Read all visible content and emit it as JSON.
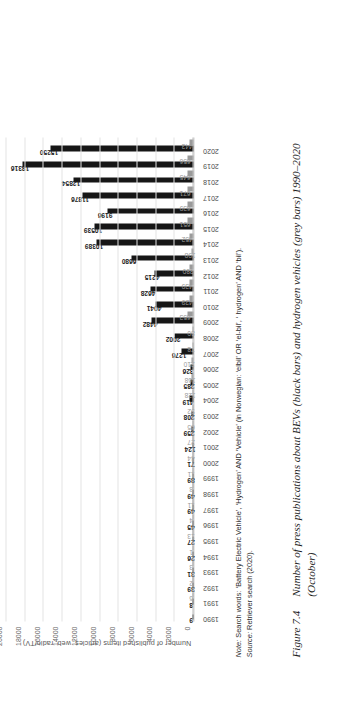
{
  "figure": {
    "number": "Figure 7.4",
    "caption_line1": "Number of press publications about BEVs (black bars) and hydrogen vehicles (grey bars) 1990–2020",
    "caption_line2": "(October)"
  },
  "note": {
    "note_label": "Note:",
    "note_text": " Search words: ‘Battery Electric Vehicle’, ‘Hydrogen’ AND ‘Vehicle’ (in Norwegian: ‘elbil’ OR ‘el-bil’, ‘ hydrogen’ AND ‘bil’).",
    "source_label": "Source:",
    "source_text": " Retriever search (2020)."
  },
  "chart_data": {
    "type": "bar",
    "title": "",
    "xlabel": "",
    "ylabel": "Number of published items (articles, web, radio/TV)",
    "ylim": [
      0,
      20000
    ],
    "yticks": [
      0,
      2000,
      4000,
      6000,
      8000,
      10000,
      12000,
      14000,
      16000,
      18000,
      20000
    ],
    "ytick_labels": [
      "0",
      "2000",
      "4000",
      "6000",
      "8000",
      "10000",
      "12000",
      "14000",
      "16000",
      "18000",
      "20000"
    ],
    "grid": true,
    "legend": "none",
    "orientation": "vertical",
    "categories": [
      "1990",
      "1991",
      "1992",
      "1993",
      "1994",
      "1995",
      "1996",
      "1997",
      "1998",
      "1999",
      "2000",
      "2001",
      "2002",
      "2003",
      "2004",
      "2005",
      "2006",
      "2007",
      "2008",
      "2009",
      "2010",
      "2011",
      "2012",
      "2013",
      "2014",
      "2015",
      "2016",
      "2017",
      "2018",
      "2019",
      "2020"
    ],
    "series": [
      {
        "name": "BEVs",
        "color": "#161616",
        "values": [
          9,
          8,
          39,
          31,
          26,
          27,
          45,
          49,
          49,
          89,
          71,
          124,
          259,
          208,
          419,
          285,
          326,
          1276,
          2002,
          4482,
          4041,
          4628,
          4215,
          6680,
          10389,
          10539,
          9196,
          11876,
          12854,
          18316,
          15250
        ]
      },
      {
        "name": "Hydrogen vehicles",
        "color": "#9a9a9a",
        "values": [
          0,
          6,
          2,
          3,
          1,
          13,
          4,
          11,
          8,
          11,
          44,
          27,
          65,
          92,
          128,
          168,
          210,
          78,
          80,
          653,
          429,
          439,
          380,
          198,
          452,
          651,
          639,
          671,
          645,
          656,
          443
        ]
      }
    ]
  }
}
